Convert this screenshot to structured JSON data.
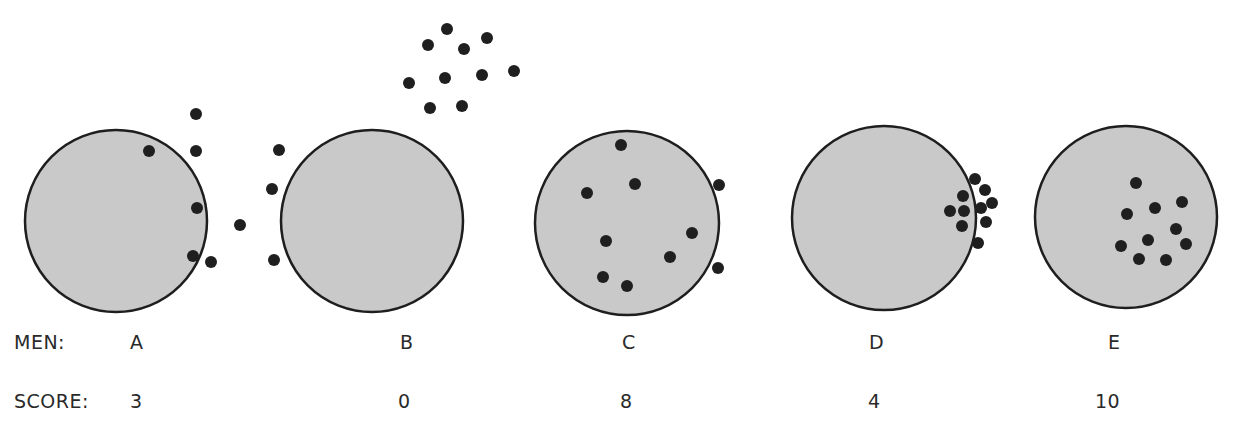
{
  "figure": {
    "row_labels": {
      "men": "MEN:",
      "score": "SCORE:"
    },
    "colors": {
      "target_fill": "#c9c9c9",
      "target_stroke": "#1e1e1e",
      "dot": "#1f1f1f",
      "text": "#2a2a2a"
    },
    "dot_radius": 6,
    "targets": [
      {
        "man": "A",
        "score": "3",
        "label_x": 130,
        "score_x": 130,
        "circle": {
          "cx": 116,
          "cy": 221,
          "r": 91
        },
        "dots": [
          [
            149,
            151
          ],
          [
            196,
            114
          ],
          [
            196,
            151
          ],
          [
            197,
            208
          ],
          [
            193,
            256
          ],
          [
            211,
            262
          ],
          [
            240,
            225
          ]
        ]
      },
      {
        "man": "B",
        "score": "0",
        "label_x": 400,
        "score_x": 398,
        "circle": {
          "cx": 372,
          "cy": 221,
          "r": 91
        },
        "dots": [
          [
            279,
            150
          ],
          [
            272,
            189
          ],
          [
            274,
            260
          ],
          [
            428,
            45
          ],
          [
            447,
            29
          ],
          [
            464,
            49
          ],
          [
            487,
            38
          ],
          [
            409,
            83
          ],
          [
            445,
            78
          ],
          [
            482,
            75
          ],
          [
            514,
            71
          ],
          [
            430,
            108
          ],
          [
            462,
            106
          ]
        ]
      },
      {
        "man": "C",
        "score": "8",
        "label_x": 622,
        "score_x": 620,
        "circle": {
          "cx": 627,
          "cy": 223,
          "r": 92
        },
        "dots": [
          [
            621,
            145
          ],
          [
            587,
            193
          ],
          [
            635,
            184
          ],
          [
            719,
            185
          ],
          [
            692,
            233
          ],
          [
            606,
            241
          ],
          [
            670,
            257
          ],
          [
            603,
            277
          ],
          [
            627,
            286
          ],
          [
            718,
            268
          ]
        ]
      },
      {
        "man": "D",
        "score": "4",
        "label_x": 869,
        "score_x": 868,
        "circle": {
          "cx": 884,
          "cy": 218,
          "r": 92
        },
        "dots": [
          [
            975,
            179
          ],
          [
            985,
            190
          ],
          [
            963,
            196
          ],
          [
            992,
            203
          ],
          [
            950,
            211
          ],
          [
            964,
            211
          ],
          [
            981,
            208
          ],
          [
            962,
            226
          ],
          [
            986,
            222
          ],
          [
            978,
            243
          ]
        ]
      },
      {
        "man": "E",
        "score": "10",
        "label_x": 1108,
        "score_x": 1095,
        "circle": {
          "cx": 1126,
          "cy": 217,
          "r": 91
        },
        "dots": [
          [
            1136,
            183
          ],
          [
            1127,
            214
          ],
          [
            1155,
            208
          ],
          [
            1182,
            202
          ],
          [
            1176,
            229
          ],
          [
            1148,
            240
          ],
          [
            1186,
            244
          ],
          [
            1121,
            246
          ],
          [
            1139,
            259
          ],
          [
            1166,
            260
          ]
        ]
      }
    ]
  }
}
